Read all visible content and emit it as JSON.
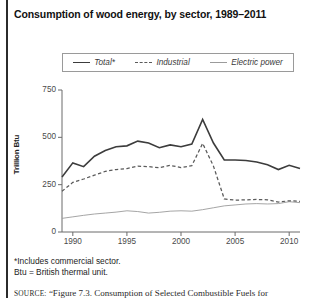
{
  "chart_data": {
    "type": "line",
    "title": "Consumption of wood energy, by sector, 1989–2011",
    "xlabel": "",
    "ylabel": "Trillion Btu",
    "xlim": [
      1989,
      2011
    ],
    "ylim": [
      0,
      750
    ],
    "yticks": [
      0,
      250,
      500,
      750
    ],
    "ytick_labels": [
      "0",
      "250",
      "500",
      "750"
    ],
    "xticks": [
      1990,
      1995,
      2000,
      2005,
      2010
    ],
    "xtick_labels": [
      "1990",
      "1995",
      "2000",
      "2005",
      "2010"
    ],
    "grid": false,
    "legend_position": "top",
    "x": [
      1989,
      1990,
      1991,
      1992,
      1993,
      1994,
      1995,
      1996,
      1997,
      1998,
      1999,
      2000,
      2001,
      2002,
      2003,
      2004,
      2005,
      2006,
      2007,
      2008,
      2009,
      2010,
      2011
    ],
    "series": [
      {
        "name": "Total*",
        "style": "solid",
        "color": "#3c3c3c",
        "values": [
          290,
          365,
          345,
          400,
          430,
          450,
          455,
          480,
          470,
          445,
          460,
          450,
          465,
          595,
          470,
          380,
          380,
          378,
          370,
          355,
          330,
          352,
          335
        ]
      },
      {
        "name": "Industrial",
        "style": "dashed",
        "color": "#5a5a5a",
        "values": [
          215,
          262,
          280,
          300,
          320,
          330,
          335,
          348,
          345,
          340,
          352,
          340,
          350,
          468,
          348,
          175,
          168,
          170,
          172,
          170,
          158,
          165,
          162
        ]
      },
      {
        "name": "Electric power",
        "style": "solid-thin",
        "color": "#9b9b9b",
        "values": [
          72,
          80,
          88,
          95,
          100,
          105,
          112,
          108,
          100,
          104,
          110,
          112,
          110,
          118,
          128,
          138,
          143,
          148,
          150,
          148,
          150,
          160,
          155
        ]
      }
    ],
    "annotations": [
      "*Includes commercial sector.",
      "Btu = British thermal unit."
    ]
  },
  "title": "Consumption of wood energy, by sector, 1989–2011",
  "legend": {
    "items": [
      {
        "label": "Total*"
      },
      {
        "label": "Industrial"
      },
      {
        "label": "Electric power"
      }
    ]
  },
  "axes": {
    "y_title": "Trillion Btu",
    "y_labels": [
      "750",
      "500",
      "250",
      "0"
    ],
    "x_labels": [
      "1990",
      "1995",
      "2000",
      "2005",
      "2010"
    ]
  },
  "footnotes": {
    "line1": "*Includes commercial sector.",
    "line2": "Btu = British thermal unit."
  },
  "source": {
    "prefix": "SOURCE:",
    "text": "“Figure 7.3. Consumption of Selected Combustible Fuels for"
  }
}
